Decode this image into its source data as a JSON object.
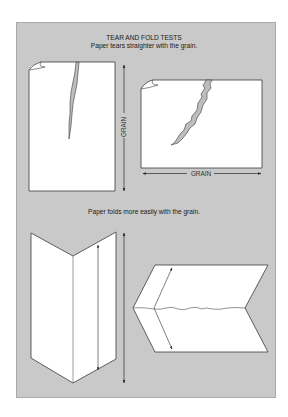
{
  "title": "TEAR AND FOLD TESTS",
  "sections": {
    "tear": {
      "caption": "Paper tears straighter with the grain."
    },
    "fold": {
      "caption": "Paper folds more easily with the grain."
    }
  },
  "labels": {
    "grain_vertical": "GRAIN",
    "grain_horizontal": "GRAIN"
  },
  "colors": {
    "panel": "#c9c9c9",
    "paper": "#ffffff",
    "line": "#3a3a3a",
    "tear_fill": "#bdbdbd"
  }
}
